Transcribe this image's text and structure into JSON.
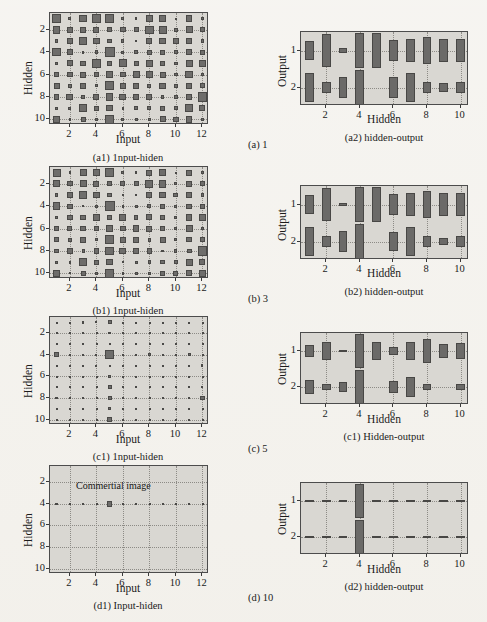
{
  "figure": {
    "background_color": "#f3f1ec",
    "plot_background_color": "#d9d7d2",
    "cell_color": "#6e6d6b",
    "axis_color": "#4c4c4c"
  },
  "panels": [
    {
      "id": "a1",
      "caption": "(a1) 1nput-hiden",
      "xlabel": "Input",
      "ylabel": "Hidden",
      "xticks": [
        "2",
        "4",
        "6",
        "8",
        "10",
        "12"
      ],
      "yticks": [
        "2",
        "4",
        "6",
        "8",
        "10"
      ],
      "annotation": ""
    },
    {
      "id": "a2",
      "caption": "(a2) hidden-output",
      "xlabel": "Hidden",
      "ylabel": "Output",
      "xticks": [
        "2",
        "4",
        "6",
        "8",
        "10"
      ],
      "yticks": [
        "1",
        "2"
      ],
      "annotation": ""
    },
    {
      "id": "b1",
      "caption": "(b1) 1nput-hiden",
      "xlabel": "Input",
      "ylabel": "Hidden",
      "xticks": [
        "2",
        "4",
        "6",
        "8",
        "10",
        "12"
      ],
      "yticks": [
        "2",
        "4",
        "6",
        "8",
        "10"
      ],
      "annotation": ""
    },
    {
      "id": "b2",
      "caption": "(b2) hidden-output",
      "xlabel": "Hidden",
      "ylabel": "Output",
      "xticks": [
        "2",
        "4",
        "6",
        "8",
        "10"
      ],
      "yticks": [
        "1",
        "2"
      ],
      "annotation": ""
    },
    {
      "id": "c1",
      "caption": "(c1) 1nput-hiden",
      "xlabel": "Input",
      "ylabel": "Hidden",
      "xticks": [
        "2",
        "4",
        "6",
        "8",
        "10",
        "12"
      ],
      "yticks": [
        "2",
        "4",
        "6",
        "8",
        "10"
      ],
      "annotation": ""
    },
    {
      "id": "c2",
      "caption": "(c1) Hidden-output",
      "xlabel": "Hidden",
      "ylabel": "Output",
      "xticks": [
        "2",
        "4",
        "6",
        "8",
        "10"
      ],
      "yticks": [
        "1",
        "2"
      ],
      "annotation": ""
    },
    {
      "id": "d1",
      "caption": "(d1) Input-hiden",
      "xlabel": "Input",
      "ylabel": "Hidden",
      "xticks": [
        "2",
        "4",
        "6",
        "8",
        "10",
        "12"
      ],
      "yticks": [
        "2",
        "4",
        "6",
        "8",
        "10"
      ],
      "annotation": "Commertial image"
    },
    {
      "id": "d2",
      "caption": "(d2) hidden-output",
      "xlabel": "Hidden",
      "ylabel": "Output",
      "xticks": [
        "2",
        "4",
        "6",
        "8",
        "10"
      ],
      "yticks": [
        "1",
        "2"
      ],
      "annotation": ""
    }
  ],
  "row_labels": [
    {
      "id": "a",
      "text": "(a) 1"
    },
    {
      "id": "b",
      "text": "(b) 3"
    },
    {
      "id": "c",
      "text": "(c) 5"
    },
    {
      "id": "d",
      "text": "(d) 10"
    }
  ],
  "chart_data": {
    "type": "heatmap",
    "legend": [],
    "grid": true,
    "charts": [
      {
        "id": "a1",
        "type": "heatmap",
        "title": "(a1) 1nput-hiden",
        "xlabel": "Input",
        "ylabel": "Hidden",
        "xlim": [
          0.5,
          12.5
        ],
        "ylim": [
          0.5,
          10.5
        ],
        "x": [
          1,
          2,
          3,
          4,
          5,
          6,
          7,
          8,
          9,
          10,
          11,
          12
        ],
        "y": [
          1,
          2,
          3,
          4,
          5,
          6,
          7,
          8,
          9,
          10
        ],
        "magnitudes": [
          [
            0.85,
            0.3,
            0.7,
            0.8,
            0.85,
            0.3,
            0.25,
            0.65,
            0.7,
            0.12,
            0.6,
            0.3
          ],
          [
            0.7,
            0.55,
            0.6,
            0.55,
            0.45,
            0.5,
            0.45,
            0.8,
            0.75,
            0.35,
            0.65,
            0.5
          ],
          [
            0.35,
            0.55,
            0.75,
            0.6,
            0.45,
            0.3,
            0.25,
            0.55,
            0.65,
            0.5,
            0.55,
            0.35
          ],
          [
            0.8,
            0.55,
            0.25,
            0.35,
            0.95,
            0.3,
            0.35,
            0.45,
            0.5,
            0.35,
            0.55,
            0.5
          ],
          [
            0.3,
            0.55,
            0.5,
            0.8,
            0.45,
            0.75,
            0.45,
            0.6,
            0.5,
            0.35,
            0.65,
            0.65
          ],
          [
            0.45,
            0.5,
            0.55,
            0.5,
            0.7,
            0.5,
            0.65,
            0.6,
            0.55,
            0.35,
            0.7,
            0.3
          ],
          [
            0.55,
            0.4,
            0.6,
            0.3,
            0.85,
            0.55,
            0.55,
            0.4,
            0.6,
            0.35,
            0.55,
            0.5
          ],
          [
            0.5,
            0.65,
            0.35,
            0.55,
            0.7,
            0.65,
            0.5,
            0.55,
            0.3,
            0.35,
            0.5,
            0.85
          ],
          [
            0.3,
            0.3,
            0.8,
            0.45,
            0.6,
            0.25,
            0.35,
            0.4,
            0.45,
            0.4,
            0.7,
            0.55
          ],
          [
            0.7,
            0.25,
            0.45,
            0.35,
            0.85,
            0.3,
            0.3,
            0.35,
            0.55,
            0.5,
            0.6,
            0.35
          ]
        ]
      },
      {
        "id": "a2",
        "type": "heatmap",
        "title": "(a2) hidden-output",
        "xlabel": "Hidden",
        "ylabel": "Output",
        "xlim": [
          0.5,
          10.5
        ],
        "ylim": [
          0.5,
          2.5
        ],
        "x": [
          1,
          2,
          3,
          4,
          5,
          6,
          7,
          8,
          9,
          10
        ],
        "y": [
          1,
          2
        ],
        "magnitudes": [
          [
            0.55,
            0.95,
            0.12,
            1.0,
            1.0,
            0.6,
            0.65,
            0.8,
            0.65,
            0.7
          ],
          [
            0.85,
            0.35,
            0.6,
            1.0,
            0.0,
            0.6,
            0.85,
            0.35,
            0.25,
            0.35
          ]
        ]
      },
      {
        "id": "b1",
        "type": "heatmap",
        "title": "(b1) 1nput-hiden",
        "xlabel": "Input",
        "ylabel": "Hidden",
        "xlim": [
          0.5,
          12.5
        ],
        "ylim": [
          0.5,
          10.5
        ],
        "x": [
          1,
          2,
          3,
          4,
          5,
          6,
          7,
          8,
          9,
          10,
          11,
          12
        ],
        "y": [
          1,
          2,
          3,
          4,
          5,
          6,
          7,
          8,
          9,
          10
        ],
        "magnitudes": [
          [
            0.75,
            0.25,
            0.65,
            0.7,
            0.8,
            0.3,
            0.25,
            0.55,
            0.65,
            0.12,
            0.55,
            0.25
          ],
          [
            0.65,
            0.5,
            0.65,
            0.55,
            0.5,
            0.45,
            0.45,
            0.75,
            0.7,
            0.3,
            0.6,
            0.5
          ],
          [
            0.3,
            0.5,
            0.7,
            0.6,
            0.45,
            0.25,
            0.2,
            0.55,
            0.6,
            0.45,
            0.5,
            0.35
          ],
          [
            0.7,
            0.5,
            0.2,
            0.3,
            0.95,
            0.25,
            0.3,
            0.4,
            0.45,
            0.3,
            0.5,
            0.45
          ],
          [
            0.25,
            0.5,
            0.5,
            0.7,
            0.4,
            0.65,
            0.4,
            0.55,
            0.45,
            0.3,
            0.6,
            0.6
          ],
          [
            0.4,
            0.45,
            0.5,
            0.5,
            0.65,
            0.5,
            0.6,
            0.55,
            0.5,
            0.3,
            0.65,
            0.25
          ],
          [
            0.5,
            0.35,
            0.55,
            0.25,
            0.85,
            0.6,
            0.55,
            0.35,
            0.55,
            0.3,
            0.5,
            0.45
          ],
          [
            0.45,
            0.6,
            0.3,
            0.5,
            0.8,
            0.65,
            0.5,
            0.5,
            0.25,
            0.3,
            0.45,
            0.9
          ],
          [
            0.3,
            0.25,
            0.75,
            0.45,
            0.6,
            0.2,
            0.3,
            0.35,
            0.4,
            0.35,
            0.65,
            0.55
          ],
          [
            0.65,
            0.2,
            0.45,
            0.3,
            0.85,
            0.25,
            0.3,
            0.3,
            0.5,
            0.45,
            0.55,
            0.65
          ]
        ]
      },
      {
        "id": "b2",
        "type": "heatmap",
        "title": "(b2) hidden-output",
        "xlabel": "Hidden",
        "ylabel": "Output",
        "xlim": [
          0.5,
          10.5
        ],
        "ylim": [
          0.5,
          2.5
        ],
        "x": [
          1,
          2,
          3,
          4,
          5,
          6,
          7,
          8,
          9,
          10
        ],
        "y": [
          1,
          2
        ],
        "magnitudes": [
          [
            0.55,
            0.95,
            0.1,
            1.0,
            1.0,
            0.6,
            0.65,
            0.8,
            0.65,
            0.7
          ],
          [
            0.85,
            0.3,
            0.6,
            1.0,
            0.0,
            0.55,
            0.85,
            0.35,
            0.2,
            0.3
          ]
        ]
      },
      {
        "id": "c1",
        "type": "heatmap",
        "title": "(c1) 1nput-hiden",
        "xlabel": "Input",
        "ylabel": "Hidden",
        "xlim": [
          0.5,
          12.5
        ],
        "ylim": [
          0.5,
          10.5
        ],
        "x": [
          1,
          2,
          3,
          4,
          5,
          6,
          7,
          8,
          9,
          10,
          11,
          12
        ],
        "y": [
          1,
          2,
          3,
          4,
          5,
          6,
          7,
          8,
          9,
          10
        ],
        "magnitudes": [
          [
            0.12,
            0.1,
            0.22,
            0.2,
            0.4,
            0.08,
            0.06,
            0.1,
            0.14,
            0.08,
            0.12,
            0.1
          ],
          [
            0.1,
            0.08,
            0.12,
            0.1,
            0.25,
            0.08,
            0.06,
            0.1,
            0.1,
            0.08,
            0.12,
            0.12
          ],
          [
            0.1,
            0.08,
            0.22,
            0.1,
            0.18,
            0.08,
            0.06,
            0.08,
            0.1,
            0.08,
            0.12,
            0.1
          ],
          [
            0.48,
            0.08,
            0.14,
            0.2,
            0.85,
            0.22,
            0.12,
            0.28,
            0.1,
            0.12,
            0.28,
            0.1
          ],
          [
            0.2,
            0.14,
            0.1,
            0.18,
            0.12,
            0.14,
            0.08,
            0.1,
            0.1,
            0.08,
            0.1,
            0.22
          ],
          [
            0.08,
            0.06,
            0.08,
            0.1,
            0.3,
            0.1,
            0.06,
            0.08,
            0.08,
            0.06,
            0.1,
            0.08
          ],
          [
            0.2,
            0.14,
            0.18,
            0.12,
            0.4,
            0.25,
            0.1,
            0.1,
            0.16,
            0.1,
            0.18,
            0.22
          ],
          [
            0.22,
            0.14,
            0.1,
            0.16,
            0.4,
            0.25,
            0.14,
            0.1,
            0.12,
            0.08,
            0.22,
            0.45
          ],
          [
            0.08,
            0.08,
            0.22,
            0.08,
            0.26,
            0.08,
            0.06,
            0.08,
            0.1,
            0.06,
            0.18,
            0.1
          ],
          [
            0.18,
            0.1,
            0.12,
            0.1,
            0.45,
            0.1,
            0.08,
            0.1,
            0.1,
            0.08,
            0.18,
            0.14
          ]
        ]
      },
      {
        "id": "c2",
        "type": "heatmap",
        "title": "(c1) Hidden-output",
        "xlabel": "Hidden",
        "ylabel": "Output",
        "xlim": [
          0.5,
          10.5
        ],
        "ylim": [
          0.5,
          2.5
        ],
        "x": [
          1,
          2,
          3,
          4,
          5,
          6,
          7,
          8,
          9,
          10
        ],
        "y": [
          1,
          2
        ],
        "magnitudes": [
          [
            0.35,
            0.55,
            0.08,
            1.0,
            0.55,
            0.25,
            0.55,
            0.7,
            0.4,
            0.5
          ],
          [
            0.45,
            0.2,
            0.3,
            1.0,
            0.0,
            0.35,
            0.6,
            0.18,
            0.0,
            0.18
          ]
        ]
      },
      {
        "id": "d1",
        "type": "heatmap",
        "title": "(d1) Input-hiden",
        "xlabel": "Input",
        "ylabel": "Hidden",
        "xlim": [
          0.5,
          12.5
        ],
        "ylim": [
          0.5,
          10.5
        ],
        "x": [
          1,
          2,
          3,
          4,
          5,
          6,
          7,
          8,
          9,
          10,
          11,
          12
        ],
        "y": [
          1,
          2,
          3,
          4,
          5,
          6,
          7,
          8,
          9,
          10
        ],
        "annotation": "Commertial image",
        "magnitudes": [
          [
            0.0,
            0.0,
            0.0,
            0.0,
            0.0,
            0.0,
            0.0,
            0.0,
            0.0,
            0.0,
            0.0,
            0.0
          ],
          [
            0.0,
            0.0,
            0.0,
            0.0,
            0.0,
            0.0,
            0.0,
            0.0,
            0.0,
            0.0,
            0.0,
            0.0
          ],
          [
            0.0,
            0.0,
            0.0,
            0.0,
            0.0,
            0.0,
            0.0,
            0.0,
            0.0,
            0.0,
            0.0,
            0.0
          ],
          [
            0.22,
            0.14,
            0.12,
            0.12,
            0.55,
            0.16,
            0.12,
            0.1,
            0.12,
            0.12,
            0.12,
            0.14
          ],
          [
            0.0,
            0.0,
            0.0,
            0.0,
            0.0,
            0.0,
            0.0,
            0.0,
            0.0,
            0.0,
            0.0,
            0.0
          ],
          [
            0.0,
            0.0,
            0.0,
            0.0,
            0.0,
            0.0,
            0.0,
            0.0,
            0.0,
            0.0,
            0.0,
            0.0
          ],
          [
            0.0,
            0.0,
            0.0,
            0.0,
            0.0,
            0.0,
            0.0,
            0.0,
            0.0,
            0.0,
            0.0,
            0.0
          ],
          [
            0.0,
            0.0,
            0.0,
            0.0,
            0.0,
            0.0,
            0.0,
            0.0,
            0.0,
            0.0,
            0.0,
            0.0
          ],
          [
            0.0,
            0.0,
            0.0,
            0.0,
            0.0,
            0.0,
            0.0,
            0.0,
            0.0,
            0.0,
            0.0,
            0.0
          ],
          [
            0.0,
            0.0,
            0.0,
            0.0,
            0.0,
            0.0,
            0.0,
            0.0,
            0.0,
            0.0,
            0.0,
            0.0
          ]
        ]
      },
      {
        "id": "d2",
        "type": "heatmap",
        "title": "(d2) hidden-output",
        "xlabel": "Hidden",
        "ylabel": "Output",
        "xlim": [
          0.5,
          10.5
        ],
        "ylim": [
          0.5,
          2.5
        ],
        "x": [
          1,
          2,
          3,
          4,
          5,
          6,
          7,
          8,
          9,
          10
        ],
        "y": [
          1,
          2
        ],
        "magnitudes": [
          [
            0.06,
            0.06,
            0.06,
            1.0,
            0.04,
            0.04,
            0.06,
            0.06,
            0.06,
            0.06
          ],
          [
            0.06,
            0.06,
            0.06,
            1.0,
            0.04,
            0.04,
            0.06,
            0.06,
            0.06,
            0.06
          ]
        ]
      }
    ]
  }
}
